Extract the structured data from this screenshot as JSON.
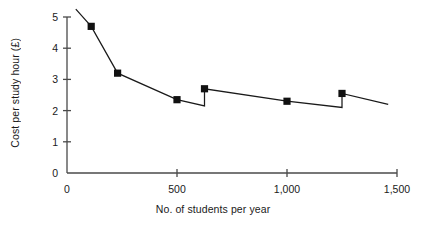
{
  "chart_data": {
    "type": "line",
    "title": "",
    "xlabel": "No. of students per year",
    "ylabel": "Cost per study hour (£)",
    "xlim": [
      0,
      1500
    ],
    "ylim": [
      0,
      5
    ],
    "xticks": [
      0,
      500,
      1000,
      1500
    ],
    "xticklabels": [
      "0",
      "500",
      "1,000",
      "1,500"
    ],
    "yticks": [
      0,
      1,
      2,
      3,
      4,
      5
    ],
    "yticklabels": [
      "0",
      "1",
      "2",
      "3",
      "4",
      "5"
    ],
    "grid": false,
    "legend": null,
    "marker": "square",
    "marker_color": "#111111",
    "line_color": "#1a1a1a",
    "series": [
      {
        "name": "Cost per study hour",
        "x": [
          110,
          230,
          500,
          625,
          1000,
          1250
        ],
        "values": [
          4.7,
          3.2,
          2.35,
          2.7,
          2.3,
          2.55
        ]
      }
    ],
    "line_path": [
      {
        "x": 40,
        "y": 5.25
      },
      {
        "x": 110,
        "y": 4.7
      },
      {
        "x": 230,
        "y": 3.2
      },
      {
        "x": 500,
        "y": 2.35
      },
      {
        "x": 625,
        "y": 2.15
      },
      {
        "x": 625,
        "y": 2.7
      },
      {
        "x": 1000,
        "y": 2.3
      },
      {
        "x": 1250,
        "y": 2.1
      },
      {
        "x": 1250,
        "y": 2.55
      },
      {
        "x": 1460,
        "y": 2.2
      }
    ]
  },
  "axes": {
    "x_axis_name": "x-axis",
    "y_axis_name": "y-axis"
  }
}
